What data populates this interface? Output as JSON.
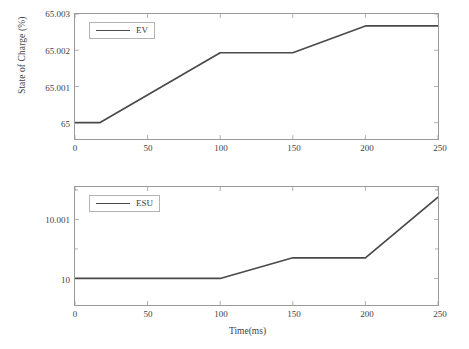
{
  "figure": {
    "ylabel": "State of Charge (%)",
    "xlabel": "Time(ms)",
    "line_color": "#4a4a4a",
    "axis_color": "#9a9a9a",
    "background": "#ffffff"
  },
  "chart_data": [
    {
      "type": "line",
      "title": "",
      "xlabel": "",
      "ylabel": "State of Charge (%)",
      "xlim": [
        0,
        250
      ],
      "ylim": [
        64.99955,
        65.003
      ],
      "xticks": [
        0,
        50,
        100,
        150,
        200,
        250
      ],
      "xticklabels": [
        "0",
        "50",
        "100",
        "150",
        "200",
        "250"
      ],
      "yticks": [
        65,
        65.001,
        65.002,
        65.003
      ],
      "yticklabels": [
        "65",
        "65.001",
        "65.002",
        "65.003"
      ],
      "grid": false,
      "legend": {
        "position": "top-left",
        "entries": [
          "EV"
        ]
      },
      "series": [
        {
          "name": "EV",
          "color": "#4a4a4a",
          "x": [
            0,
            17,
            100,
            150,
            200,
            250
          ],
          "values": [
            65,
            65,
            65.00193,
            65.00193,
            65.00267,
            65.00267
          ]
        }
      ]
    },
    {
      "type": "line",
      "title": "",
      "xlabel": "Time(ms)",
      "ylabel": "State of Charge (%)",
      "xlim": [
        0,
        250
      ],
      "ylim": [
        9.99955,
        10.00155
      ],
      "xticks": [
        0,
        50,
        100,
        150,
        200,
        250
      ],
      "xticklabels": [
        "0",
        "50",
        "100",
        "150",
        "200",
        "250"
      ],
      "yticks": [
        10,
        10.001
      ],
      "yticklabels": [
        "10",
        "10.001"
      ],
      "grid": false,
      "legend": {
        "position": "top-left",
        "entries": [
          "ESU"
        ]
      },
      "series": [
        {
          "name": "ESU",
          "color": "#4a4a4a",
          "x": [
            0,
            100,
            150,
            200,
            250
          ],
          "values": [
            10,
            10,
            10.00035,
            10.00035,
            10.00138
          ]
        }
      ]
    }
  ]
}
